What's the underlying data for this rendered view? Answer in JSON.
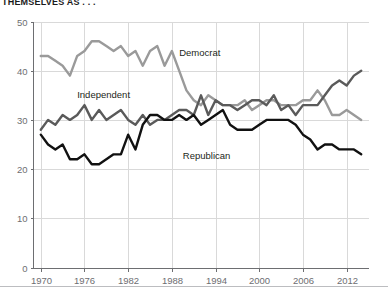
{
  "header": {
    "kicker": "THEMSELVES AS . . ."
  },
  "chart_data": {
    "type": "line",
    "title": "THEMSELVES AS . . .",
    "xlabel": "",
    "ylabel": "",
    "xlim": [
      1969,
      2015
    ],
    "ylim": [
      0,
      50
    ],
    "yticks": [
      0,
      10,
      20,
      30,
      40,
      50
    ],
    "xticks": [
      1970,
      1976,
      1982,
      1988,
      1994,
      2000,
      2006,
      2012
    ],
    "grid": true,
    "legend_position": "inline-annotations",
    "annotations": [
      {
        "text": "Democrat",
        "x": 1989,
        "y": 43
      },
      {
        "text": "Independent",
        "x": 1975,
        "y": 34.5
      },
      {
        "text": "Republican",
        "x": 1989.5,
        "y": 22
      }
    ],
    "colors": {
      "democrat": "#9a9a9a",
      "independent": "#5a5a5a",
      "republican": "#111111",
      "grid": "#d9d9d9",
      "axis": "#6d6e71"
    },
    "x": [
      1970,
      1971,
      1972,
      1973,
      1974,
      1975,
      1976,
      1977,
      1978,
      1979,
      1980,
      1981,
      1982,
      1983,
      1984,
      1985,
      1986,
      1987,
      1988,
      1989,
      1990,
      1991,
      1992,
      1993,
      1994,
      1995,
      1996,
      1997,
      1998,
      1999,
      2000,
      2001,
      2002,
      2003,
      2004,
      2005,
      2006,
      2007,
      2008,
      2009,
      2010,
      2011,
      2012,
      2013,
      2014
    ],
    "series": [
      {
        "name": "Democrat",
        "color": "#9a9a9a",
        "values": [
          43,
          43,
          42,
          41,
          39,
          43,
          44,
          46,
          46,
          45,
          44,
          45,
          43,
          44,
          41,
          44,
          45,
          41,
          44,
          40,
          36,
          34,
          33,
          35,
          34,
          33,
          33,
          33,
          34,
          32,
          33,
          34,
          34,
          33,
          33,
          33,
          34,
          34,
          36,
          34,
          31,
          31,
          32,
          31,
          30
        ]
      },
      {
        "name": "Independent",
        "color": "#5a5a5a",
        "values": [
          28,
          30,
          29,
          31,
          30,
          31,
          33,
          30,
          32,
          30,
          31,
          32,
          30,
          29,
          31,
          29,
          30,
          30,
          31,
          32,
          32,
          31,
          35,
          31,
          34,
          33,
          33,
          32,
          33,
          34,
          34,
          33,
          35,
          32,
          33,
          31,
          33,
          33,
          33,
          35,
          37,
          38,
          37,
          39,
          40
        ]
      },
      {
        "name": "Republican",
        "color": "#111111",
        "values": [
          27,
          25,
          24,
          25,
          22,
          22,
          23,
          21,
          21,
          22,
          23,
          23,
          27,
          24,
          29,
          31,
          31,
          30,
          30,
          31,
          30,
          31,
          29,
          30,
          31,
          32,
          29,
          28,
          28,
          28,
          29,
          30,
          30,
          30,
          30,
          29,
          27,
          26,
          24,
          25,
          25,
          24,
          24,
          24,
          23
        ]
      }
    ]
  }
}
